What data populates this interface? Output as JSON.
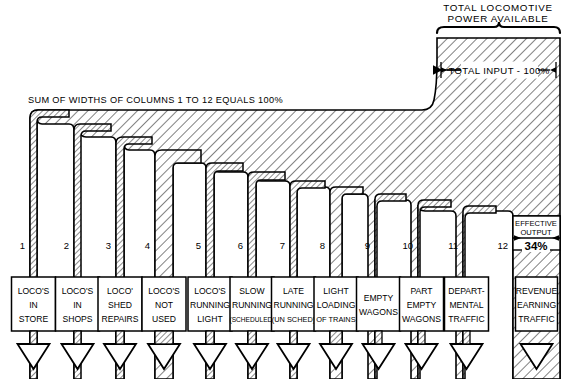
{
  "diagram": {
    "title": "TOTAL  LOCOMOTIVE",
    "title_line2": "POWER AVAILABLE",
    "input_label": "TOTAL INPUT - 100%",
    "sum_note": "SUM OF WIDTHS OF COLUMNS 1 TO 12 EQUALS 100%",
    "output_label_line1": "EFFECTIVE",
    "output_label_line2": "OUTPUT",
    "output_value": "34%",
    "ink": "#000000",
    "paper": "#ffffff"
  },
  "chart_data": {
    "type": "bar",
    "xlabel": "",
    "ylabel": "",
    "categories": [
      "LOCO'S IN STORE",
      "LOCO'S IN SHOPS",
      "LOCO' SHED REPAIRS",
      "LOCO'S NOT USED",
      "LOCO'S RUNNING LIGHT",
      "SLOW RUNNING (SCHEDULED)",
      "LATE RUNNING (UN SCHED)",
      "LIGHT LOADING OF TRAINS",
      "EMPTY WAGONS",
      "PART EMPTY WAGONS",
      "DEPARTMENTAL TRAFFIC",
      "REVENUE EARNING TRAFFIC"
    ],
    "values": [
      6,
      6,
      6,
      17,
      6,
      6,
      6,
      11,
      6,
      6,
      6,
      34
    ]
  },
  "columns": [
    {
      "num": "1",
      "x": 30,
      "w": 7,
      "top": 118,
      "lines": [
        "LOCO'S",
        "IN",
        "STORE"
      ],
      "wide": false
    },
    {
      "num": "2",
      "x": 74,
      "w": 7,
      "top": 130,
      "lines": [
        "LOCO'S",
        "IN",
        "SHOPS"
      ],
      "wide": false
    },
    {
      "num": "3",
      "x": 116,
      "w": 8,
      "top": 143,
      "lines": [
        "LOCO'",
        "SHED",
        "REPAIRS"
      ],
      "wide": false
    },
    {
      "num": "4",
      "x": 155,
      "w": 18,
      "top": 156,
      "lines": [
        "LOCO'S",
        "NOT",
        "USED"
      ],
      "wide": true
    },
    {
      "num": "5",
      "x": 206,
      "w": 8,
      "top": 168,
      "lines": [
        "LOCO'S",
        "RUNNING",
        "LIGHT"
      ],
      "wide": false
    },
    {
      "num": "6",
      "x": 248,
      "w": 8,
      "top": 177,
      "lines": [
        "SLOW",
        "RUNNING",
        "(SCHEDULED)"
      ],
      "wide": false
    },
    {
      "num": "7",
      "x": 290,
      "w": 7,
      "top": 186,
      "lines": [
        "LATE",
        "RUNNING",
        "(UN SCHED)"
      ],
      "wide": false
    },
    {
      "num": "8",
      "x": 330,
      "w": 12,
      "top": 192,
      "lines": [
        "LIGHT",
        "LOADING",
        "OF TRAINS"
      ],
      "wide": true
    },
    {
      "num": "9",
      "x": 375,
      "w": 7,
      "top": 199,
      "lines": [
        "EMPTY",
        "WAGONS"
      ],
      "wide": false
    },
    {
      "num": "10",
      "x": 418,
      "w": 7,
      "top": 205,
      "lines": [
        "PART",
        "EMPTY",
        "WAGONS"
      ],
      "wide": false
    },
    {
      "num": "11",
      "x": 463,
      "w": 7,
      "top": 211,
      "lines": [
        "DEPART-",
        "MENTAL",
        "TRAFFIC"
      ],
      "wide": false
    },
    {
      "num": "12",
      "x": 513,
      "w": 47,
      "top": 216,
      "lines": [
        "REVENUE",
        "EARNING",
        "TRAFFIC"
      ],
      "wide": true
    }
  ],
  "geometry": {
    "block_left": 437,
    "block_right": 560,
    "block_top": 38,
    "baseline_y": 379,
    "box_top": 277,
    "box_height": 54,
    "number_y": 249,
    "input_arrow_y": 70
  }
}
